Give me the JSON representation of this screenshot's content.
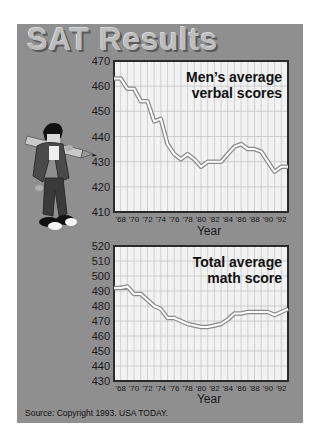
{
  "title": "SAT Results",
  "source": "Source: Copyright 1993. USA TODAY.",
  "colors": {
    "panel": "#8f8f8f",
    "plot_bg": "#f2f2f2",
    "grid": "#c8c8c8",
    "frame": "#2a2a2a",
    "line_outline": "#8a8a8a",
    "line_fill": "#ffffff"
  },
  "chart_data": [
    {
      "type": "line",
      "title": "Men's average verbal scores",
      "title_lines": [
        "Men’s average",
        "verbal scores"
      ],
      "xlabel": "Year",
      "ylabel": "",
      "ylim": [
        410,
        470
      ],
      "yticks": [
        410,
        420,
        430,
        440,
        450,
        460,
        470
      ],
      "xtick_labels": [
        "'68",
        "'70",
        "'72",
        "'74",
        "'76",
        "'78",
        "'80",
        "'82",
        "'84",
        "'86",
        "'88",
        "'90",
        "'92"
      ],
      "grid": true,
      "legend": "none",
      "x": [
        1967,
        1968,
        1969,
        1970,
        1971,
        1972,
        1973,
        1974,
        1975,
        1976,
        1977,
        1978,
        1979,
        1980,
        1981,
        1982,
        1983,
        1984,
        1985,
        1986,
        1987,
        1988,
        1989,
        1990,
        1991,
        1992,
        1993
      ],
      "series": [
        {
          "name": "Men's average verbal score",
          "values": [
            463,
            463,
            459,
            459,
            454,
            454,
            446,
            447,
            437,
            433,
            431,
            433,
            431,
            428,
            430,
            430,
            430,
            433,
            436,
            437,
            435,
            435,
            434,
            430,
            426,
            428,
            428
          ]
        }
      ]
    },
    {
      "type": "line",
      "title": "Total average math score",
      "title_lines": [
        "Total average",
        "math score"
      ],
      "xlabel": "Year",
      "ylabel": "",
      "ylim": [
        430,
        520
      ],
      "yticks": [
        430,
        440,
        450,
        460,
        470,
        480,
        490,
        500,
        510,
        520
      ],
      "xtick_labels": [
        "'68",
        "'70",
        "'72",
        "'74",
        "'76",
        "'78",
        "'80",
        "'82",
        "'84",
        "'86",
        "'88",
        "'90",
        "'92"
      ],
      "grid": true,
      "legend": "none",
      "x": [
        1967,
        1968,
        1969,
        1970,
        1971,
        1972,
        1973,
        1974,
        1975,
        1976,
        1977,
        1978,
        1979,
        1980,
        1981,
        1982,
        1983,
        1984,
        1985,
        1986,
        1987,
        1988,
        1989,
        1990,
        1991,
        1992,
        1993
      ],
      "series": [
        {
          "name": "Total average math score",
          "values": [
            492,
            492,
            493,
            488,
            488,
            484,
            480,
            478,
            472,
            472,
            470,
            468,
            467,
            466,
            466,
            467,
            468,
            471,
            475,
            475,
            476,
            476,
            476,
            476,
            474,
            476,
            478
          ]
        }
      ]
    }
  ],
  "mascot": {
    "icon": "student-with-pencil-icon"
  }
}
